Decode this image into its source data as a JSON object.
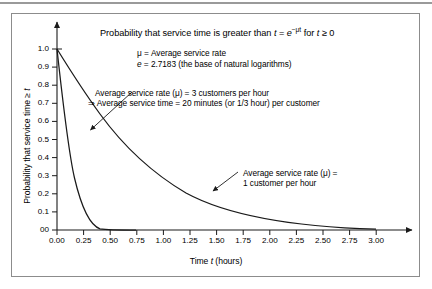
{
  "figure": {
    "title": "Probability that service time is greater than t = e−μt for t ≥ 0",
    "title_parts": {
      "lead": "Probability that service time is greater than ",
      "var_t": "t",
      "equals": " = ",
      "base_e": "e",
      "exponent": "−μt",
      "for_text": " for ",
      "var_t2": "t",
      "ge_zero": " ≥ 0"
    },
    "legend_lines": [
      "μ = Average service rate",
      "e = 2.7183 (the base of natural logarithms)"
    ],
    "legend_mu_label": "μ = Average service rate",
    "legend_e_prefix": "e",
    "legend_e_rest": " = 2.7183 (the base of natural logarithms)",
    "annotation_fast": {
      "line1": "Average service rate (μ) = 3 customers per hour",
      "line2": "⇒ Average service time = 20 minutes (or 1/3 hour) per customer"
    },
    "annotation_slow": {
      "line1": "Average service rate (μ) =",
      "line2": "1 customer per hour"
    },
    "y_axis_title_prefix": "Probability that service time ≥ ",
    "y_axis_title_var": "t",
    "x_axis_title_prefix": "Time ",
    "x_axis_title_var": "t",
    "x_axis_title_suffix": " (hours)"
  },
  "chart_data": {
    "type": "line",
    "xlabel": "Time t (hours)",
    "ylabel": "Probability that service time ≥ t",
    "xlim": [
      0,
      3.0
    ],
    "ylim": [
      0,
      1.0
    ],
    "grid": false,
    "legend": "annotations-inline",
    "xticks": [
      "0.00",
      "0.25",
      "0.50",
      "0.75",
      "1.00",
      "1.25",
      "1.50",
      "1.75",
      "2.00",
      "2.25",
      "2.50",
      "2.75",
      "3.00"
    ],
    "xtick_values": [
      0,
      0.25,
      0.5,
      0.75,
      1.0,
      1.25,
      1.5,
      1.75,
      2.0,
      2.25,
      2.5,
      2.75,
      3.0
    ],
    "yticks": [
      "00",
      "0.1",
      "0.2",
      "0.3",
      "0.4",
      "0.5",
      "0.6",
      "0.7",
      "0.8",
      "0.9",
      "1.0"
    ],
    "ytick_values": [
      0,
      0.1,
      0.2,
      0.3,
      0.4,
      0.5,
      0.6,
      0.7,
      0.8,
      0.9,
      1.0
    ],
    "x": [
      0,
      0.25,
      0.5,
      0.75,
      1.0,
      1.25,
      1.5,
      1.75,
      2.0,
      2.25,
      2.5,
      2.75,
      3.0
    ],
    "series": [
      {
        "name": "Average service rate (μ) = 3 customers per hour",
        "mu": 3,
        "formula": "e^(-3t)",
        "values": [
          1.0,
          0.472,
          0.223,
          0.105,
          0.0498,
          0.0235,
          0.0111,
          0.00525,
          0.00248,
          0.00117,
          0.000553,
          0.000261,
          0.000123
        ],
        "color": "#1a1a1a"
      },
      {
        "name": "Average service rate (μ) = 1 customer per hour",
        "mu": 1,
        "formula": "e^(-t)",
        "values": [
          1.0,
          0.779,
          0.607,
          0.472,
          0.368,
          0.287,
          0.223,
          0.174,
          0.135,
          0.105,
          0.0821,
          0.0639,
          0.0498
        ],
        "color": "#1a1a1a"
      }
    ]
  },
  "colors": {
    "curve": "#1a1a1a",
    "axis": "#1a1a1a",
    "frame": "#8c8c8c",
    "top_rule": "#9a9a9a",
    "text": "#000000"
  }
}
